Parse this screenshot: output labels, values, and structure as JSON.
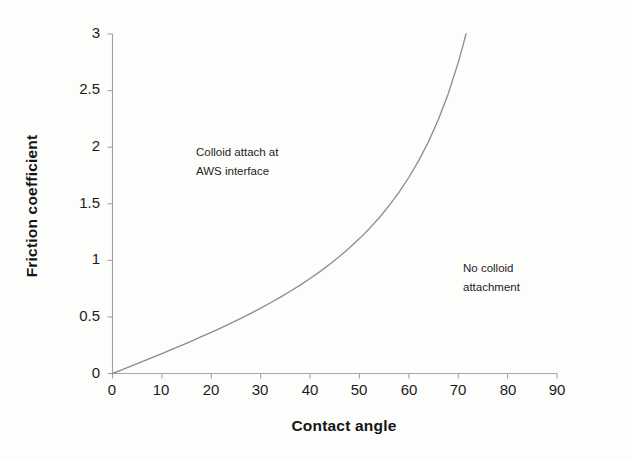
{
  "chart_data": {
    "type": "line",
    "title": "",
    "xlabel": "Contact angle",
    "ylabel": "Friction coefficient",
    "xlim": [
      0,
      90
    ],
    "ylim": [
      0,
      3
    ],
    "xticks": [
      "0",
      "10",
      "20",
      "30",
      "40",
      "50",
      "60",
      "70",
      "80",
      "90"
    ],
    "yticks": [
      "0",
      "0.5",
      "1",
      "1.5",
      "2",
      "2.5",
      "3"
    ],
    "grid": false,
    "legend": null,
    "series": [
      {
        "name": "Friction coefficient vs contact angle",
        "relation": "friction coefficient = tan(contact angle)",
        "color": "#8d8d8d",
        "x": [
          0,
          2,
          4,
          6,
          8,
          10,
          12,
          14,
          16,
          18,
          20,
          22,
          24,
          26,
          28,
          30,
          32,
          34,
          36,
          38,
          40,
          42,
          44,
          46,
          48,
          50,
          52,
          54,
          56,
          58,
          60,
          62,
          64,
          66,
          68,
          70,
          71,
          71.57
        ],
        "values": [
          0,
          0.035,
          0.07,
          0.105,
          0.141,
          0.176,
          0.213,
          0.249,
          0.287,
          0.325,
          0.364,
          0.404,
          0.445,
          0.488,
          0.532,
          0.577,
          0.625,
          0.675,
          0.727,
          0.781,
          0.839,
          0.9,
          0.966,
          1.036,
          1.111,
          1.192,
          1.28,
          1.376,
          1.483,
          1.6,
          1.732,
          1.881,
          2.05,
          2.246,
          2.475,
          2.747,
          2.904,
          3.0
        ]
      }
    ],
    "annotations": [
      {
        "id": "left-region",
        "lines": [
          "Colloid attach at",
          "AWS interface"
        ],
        "x_data": 19,
        "y_data": 2.02
      },
      {
        "id": "right-region",
        "lines": [
          "No colloid",
          "attachment"
        ],
        "x_data": 67,
        "y_data": 1.05
      }
    ]
  },
  "axes": {
    "x_title": "Contact angle",
    "y_title": "Friction coefficient"
  },
  "xticklabels": {
    "t0": "0",
    "t1": "10",
    "t2": "20",
    "t3": "30",
    "t4": "40",
    "t5": "50",
    "t6": "60",
    "t7": "70",
    "t8": "80",
    "t9": "90"
  },
  "yticklabels": {
    "t0": "0",
    "t1": "0.5",
    "t2": "1",
    "t3": "1.5",
    "t4": "2",
    "t5": "2.5",
    "t6": "3"
  },
  "annotations": {
    "left_line1": "Colloid attach at",
    "left_line2": "AWS interface",
    "right_line1": "No colloid",
    "right_line2": "attachment"
  },
  "colors": {
    "curve": "#8d8d8d",
    "axis": "#9a9a9a",
    "text": "#1c1c1c",
    "background": "#fdfdfc"
  }
}
